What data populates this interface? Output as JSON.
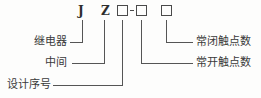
{
  "diagram": {
    "type": "model-designation-breakdown",
    "code_string": "J Z □-□ □",
    "stroke_color": "#555555",
    "text_color": "#3a3a3a",
    "code_symbols": [
      {
        "id": "sym-J",
        "text": "J",
        "kind": "letter",
        "x": 78,
        "y": 5
      },
      {
        "id": "sym-Z",
        "text": "Z",
        "kind": "letter",
        "x": 101,
        "y": 5
      },
      {
        "id": "box-1",
        "text": "",
        "kind": "box",
        "x": 117,
        "y": 5
      },
      {
        "id": "dash-1",
        "text": "-",
        "kind": "dash",
        "x": 130,
        "y": 10
      },
      {
        "id": "box-2",
        "text": "",
        "kind": "box",
        "x": 136,
        "y": 5
      },
      {
        "id": "box-3",
        "text": "",
        "kind": "box",
        "x": 161,
        "y": 5
      }
    ],
    "labels_left": [
      {
        "id": "label-relay",
        "text": "继电器",
        "meaning": "relay",
        "x": 34,
        "y": 37
      },
      {
        "id": "label-intermediate",
        "text": "中间",
        "meaning": "intermediate",
        "x": 45,
        "y": 58
      },
      {
        "id": "label-design-no",
        "text": "设计序号",
        "meaning": "design serial no.",
        "x": 7,
        "y": 79
      }
    ],
    "labels_right": [
      {
        "id": "label-nc-contacts",
        "text": "常闭触点数",
        "meaning": "number of normally-closed contacts",
        "x": 196,
        "y": 37
      },
      {
        "id": "label-no-contacts",
        "text": "常开触点数",
        "meaning": "number of normally-open contacts",
        "x": 196,
        "y": 58
      }
    ],
    "leaders": [
      {
        "id": "leader-relay",
        "from": "sym-J",
        "to": "label-relay",
        "path": "M82,20 L82,42 L70,42"
      },
      {
        "id": "leader-intermediate",
        "from": "sym-Z",
        "to": "label-intermediate",
        "path": "M104,20 L104,63 L72,63"
      },
      {
        "id": "leader-design-no",
        "from": "box-1",
        "to": "label-design-no",
        "path": "M122,20 L122,85 L53,85"
      },
      {
        "id": "leader-nc-contacts",
        "from": "box-3",
        "to": "label-nc-contacts",
        "path": "M166,20 L166,42 L193,42"
      },
      {
        "id": "leader-no-contacts",
        "from": "box-2",
        "to": "label-no-contacts",
        "path": "M141,20 L141,63 L193,63"
      }
    ]
  }
}
